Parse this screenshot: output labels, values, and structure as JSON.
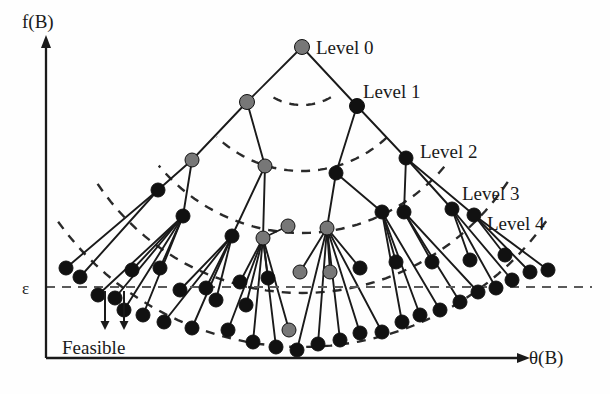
{
  "figure": {
    "type": "tree-diagram",
    "background": "#fefefe",
    "width": 610,
    "height": 394
  },
  "axes": {
    "y_label": "f(B)",
    "x_label": "θ(B)",
    "y_axis_x": 46,
    "x_axis_y": 358,
    "y_axis_top": 44,
    "x_axis_right": 520,
    "color": "#1a1a1a"
  },
  "threshold": {
    "label": "ε",
    "y": 287,
    "x_start": 46,
    "x_end": 592,
    "color": "#5a5a5a",
    "dash": "9 7"
  },
  "feasible": {
    "label": "Feasible",
    "label_x": 62,
    "label_y": 348,
    "arrows": [
      {
        "x": 105,
        "y_start": 291,
        "y_end": 330
      },
      {
        "x": 124,
        "y_start": 291,
        "y_end": 330
      }
    ],
    "color": "#1a1a1a"
  },
  "levels": [
    {
      "label": "Level 0",
      "x": 316,
      "y": 54
    },
    {
      "label": "Level 1",
      "x": 363,
      "y": 98
    },
    {
      "label": "Level 2",
      "x": 420,
      "y": 158
    },
    {
      "label": "Level 3",
      "x": 462,
      "y": 200
    },
    {
      "label": "Level 4",
      "x": 487,
      "y": 230
    }
  ],
  "node_colors": {
    "visited": "#777777",
    "explored": "#111111",
    "stroke": "#111111"
  },
  "edge_style": {
    "color": "#1a1a1a",
    "width": 1.9
  },
  "arc_style": {
    "color": "#2a2a2a",
    "width": 2.4,
    "dash": "9 8"
  },
  "chart_data": {
    "type": "scatter",
    "title": "",
    "xlabel": "θ(B)",
    "ylabel": "f(B)",
    "arcs": [
      {
        "level": 1,
        "radius": 58
      },
      {
        "level": 2,
        "radius": 124
      },
      {
        "level": 3,
        "radius": 186
      },
      {
        "level": 4,
        "radius": 246
      },
      {
        "level": 5,
        "radius": 300
      }
    ],
    "arc_center": {
      "x": 302,
      "y": 47
    },
    "nodes": [
      {
        "id": "n0",
        "level": 0,
        "x": 302,
        "y": 47,
        "color": "visited",
        "r": 7.5
      },
      {
        "id": "n1a",
        "level": 1,
        "x": 247,
        "y": 102,
        "color": "visited",
        "r": 7.5
      },
      {
        "id": "n1b",
        "level": 1,
        "x": 357,
        "y": 106,
        "color": "explored",
        "r": 7.5
      },
      {
        "id": "n2a",
        "level": 2,
        "x": 192,
        "y": 160,
        "color": "visited",
        "r": 7.0
      },
      {
        "id": "n2b",
        "level": 2,
        "x": 265,
        "y": 166,
        "color": "visited",
        "r": 7.0
      },
      {
        "id": "n2c",
        "level": 2,
        "x": 336,
        "y": 173,
        "color": "explored",
        "r": 7.0
      },
      {
        "id": "n2d",
        "level": 2,
        "x": 406,
        "y": 158,
        "color": "explored",
        "r": 7.0
      },
      {
        "id": "n3a",
        "level": 3,
        "x": 158,
        "y": 190,
        "color": "explored",
        "r": 7.0
      },
      {
        "id": "n3b",
        "level": 3,
        "x": 183,
        "y": 216,
        "color": "explored",
        "r": 7.0
      },
      {
        "id": "n3c",
        "level": 3,
        "x": 232,
        "y": 236,
        "color": "explored",
        "r": 7.0
      },
      {
        "id": "n3d",
        "level": 3,
        "x": 263,
        "y": 238,
        "color": "visited",
        "r": 7.0
      },
      {
        "id": "n3e",
        "level": 3,
        "x": 327,
        "y": 228,
        "color": "visited",
        "r": 7.0
      },
      {
        "id": "n3f",
        "level": 3,
        "x": 382,
        "y": 212,
        "color": "explored",
        "r": 7.0
      },
      {
        "id": "n3g",
        "level": 3,
        "x": 404,
        "y": 212,
        "color": "explored",
        "r": 7.0
      },
      {
        "id": "n3h",
        "level": 3,
        "x": 452,
        "y": 209,
        "color": "explored",
        "r": 7.0
      },
      {
        "id": "n3i",
        "level": 3,
        "x": 474,
        "y": 215,
        "color": "explored",
        "r": 7.0
      },
      {
        "id": "n4a",
        "level": 4,
        "x": 66,
        "y": 268,
        "color": "explored",
        "r": 7.0
      },
      {
        "id": "n4b",
        "level": 4,
        "x": 80,
        "y": 277,
        "color": "explored",
        "r": 7.0
      },
      {
        "id": "n4c",
        "level": 4,
        "x": 98,
        "y": 295,
        "color": "explored",
        "r": 7.0
      },
      {
        "id": "n4d",
        "level": 4,
        "x": 115,
        "y": 298,
        "color": "explored",
        "r": 7.0
      },
      {
        "id": "n4e",
        "level": 4,
        "x": 132,
        "y": 270,
        "color": "explored",
        "r": 7.0
      },
      {
        "id": "n4f",
        "level": 4,
        "x": 160,
        "y": 268,
        "color": "explored",
        "r": 7.0
      },
      {
        "id": "n4g",
        "level": 4,
        "x": 124,
        "y": 310,
        "color": "explored",
        "r": 7.0
      },
      {
        "id": "n4h",
        "level": 4,
        "x": 143,
        "y": 315,
        "color": "explored",
        "r": 7.0
      },
      {
        "id": "n4i",
        "level": 4,
        "x": 180,
        "y": 290,
        "color": "explored",
        "r": 7.0
      },
      {
        "id": "n4j",
        "level": 4,
        "x": 164,
        "y": 322,
        "color": "explored",
        "r": 7.0
      },
      {
        "id": "n4k",
        "level": 4,
        "x": 206,
        "y": 288,
        "color": "explored",
        "r": 7.0
      },
      {
        "id": "n4l",
        "level": 4,
        "x": 192,
        "y": 328,
        "color": "explored",
        "r": 7.0
      },
      {
        "id": "n4m",
        "level": 4,
        "x": 228,
        "y": 330,
        "color": "explored",
        "r": 7.0
      },
      {
        "id": "n4n",
        "level": 4,
        "x": 253,
        "y": 342,
        "color": "explored",
        "r": 7.0
      },
      {
        "id": "n4o",
        "level": 4,
        "x": 276,
        "y": 347,
        "color": "explored",
        "r": 7.0
      },
      {
        "id": "n4p",
        "level": 4,
        "x": 297,
        "y": 350,
        "color": "explored",
        "r": 7.0
      },
      {
        "id": "n4q",
        "level": 4,
        "x": 289,
        "y": 330,
        "color": "visited",
        "r": 7.0
      },
      {
        "id": "n4r",
        "level": 4,
        "x": 318,
        "y": 344,
        "color": "explored",
        "r": 7.0
      },
      {
        "id": "n4s",
        "level": 4,
        "x": 340,
        "y": 340,
        "color": "explored",
        "r": 7.0
      },
      {
        "id": "n4t",
        "level": 4,
        "x": 360,
        "y": 333,
        "color": "explored",
        "r": 7.0
      },
      {
        "id": "n4u",
        "level": 4,
        "x": 382,
        "y": 332,
        "color": "explored",
        "r": 7.0
      },
      {
        "id": "n4v",
        "level": 4,
        "x": 402,
        "y": 322,
        "color": "explored",
        "r": 7.0
      },
      {
        "id": "n4w",
        "level": 4,
        "x": 420,
        "y": 315,
        "color": "explored",
        "r": 7.0
      },
      {
        "id": "n4x",
        "level": 4,
        "x": 440,
        "y": 310,
        "color": "explored",
        "r": 7.0
      },
      {
        "id": "n4y",
        "level": 4,
        "x": 460,
        "y": 302,
        "color": "explored",
        "r": 7.0
      },
      {
        "id": "n4z",
        "level": 4,
        "x": 478,
        "y": 292,
        "color": "explored",
        "r": 7.0
      },
      {
        "id": "n4aa",
        "level": 4,
        "x": 496,
        "y": 288,
        "color": "explored",
        "r": 7.0
      },
      {
        "id": "n4ab",
        "level": 4,
        "x": 512,
        "y": 280,
        "color": "explored",
        "r": 7.0
      },
      {
        "id": "n4ac",
        "level": 4,
        "x": 530,
        "y": 272,
        "color": "explored",
        "r": 7.0
      },
      {
        "id": "n4ad",
        "level": 4,
        "x": 548,
        "y": 270,
        "color": "explored",
        "r": 7.0
      },
      {
        "id": "n4ae",
        "level": 4,
        "x": 505,
        "y": 255,
        "color": "explored",
        "r": 7.0
      },
      {
        "id": "n4af",
        "level": 4,
        "x": 470,
        "y": 260,
        "color": "explored",
        "r": 7.0
      },
      {
        "id": "n4ag",
        "level": 4,
        "x": 432,
        "y": 262,
        "color": "explored",
        "r": 7.0
      },
      {
        "id": "n4ah",
        "level": 4,
        "x": 396,
        "y": 262,
        "color": "explored",
        "r": 7.0
      },
      {
        "id": "n4ai",
        "level": 4,
        "x": 360,
        "y": 268,
        "color": "explored",
        "r": 7.0
      },
      {
        "id": "n4aj",
        "level": 4,
        "x": 330,
        "y": 272,
        "color": "visited",
        "r": 7.0
      },
      {
        "id": "n4ak",
        "level": 4,
        "x": 300,
        "y": 272,
        "color": "visited",
        "r": 7.0
      },
      {
        "id": "n4al",
        "level": 4,
        "x": 268,
        "y": 278,
        "color": "explored",
        "r": 7.0
      },
      {
        "id": "n4am",
        "level": 4,
        "x": 240,
        "y": 282,
        "color": "explored",
        "r": 7.0
      },
      {
        "id": "n4an",
        "level": 4,
        "x": 288,
        "y": 226,
        "color": "visited",
        "r": 7.0
      },
      {
        "id": "n4ao",
        "level": 4,
        "x": 216,
        "y": 300,
        "color": "explored",
        "r": 7.0
      },
      {
        "id": "n4ap",
        "level": 4,
        "x": 246,
        "y": 305,
        "color": "explored",
        "r": 7.0
      }
    ],
    "legend": [],
    "grid": false
  }
}
